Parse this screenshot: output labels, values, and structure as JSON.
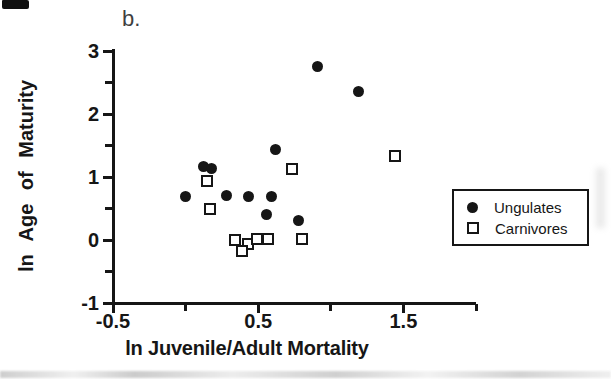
{
  "panel_label": "b.",
  "colors": {
    "ink": "#161616",
    "scan_band": "#c6c6c6"
  },
  "chart_data": {
    "type": "scatter",
    "title": "",
    "xlabel": "ln Juvenile/Adult Mortality",
    "ylabel": "ln Age of Maturity",
    "xlim": [
      -0.5,
      2.0
    ],
    "ylim": [
      -1,
      3
    ],
    "grid": false,
    "legend_position": "right-middle",
    "x_ticks": [
      {
        "v": -0.5,
        "label": "-0.5"
      },
      {
        "v": 0.0,
        "label": ""
      },
      {
        "v": 0.5,
        "label": "0.5"
      },
      {
        "v": 1.0,
        "label": ""
      },
      {
        "v": 1.5,
        "label": "1.5"
      },
      {
        "v": 2.0,
        "label": ""
      }
    ],
    "y_ticks": [
      {
        "v": 3,
        "label": "3"
      },
      {
        "v": 2.5,
        "label": ""
      },
      {
        "v": 2,
        "label": "2"
      },
      {
        "v": 1.5,
        "label": ""
      },
      {
        "v": 1,
        "label": "1"
      },
      {
        "v": 0.5,
        "label": ""
      },
      {
        "v": 0,
        "label": "0"
      },
      {
        "v": -0.5,
        "label": ""
      },
      {
        "v": -1,
        "label": "-1"
      }
    ],
    "series": [
      {
        "name": "Ungulates",
        "marker": "filled-circle",
        "points": [
          [
            0.91,
            2.76
          ],
          [
            1.19,
            2.35
          ],
          [
            0.62,
            1.43
          ],
          [
            0.12,
            1.16
          ],
          [
            0.18,
            1.13
          ],
          [
            0.0,
            0.69
          ],
          [
            0.28,
            0.7
          ],
          [
            0.43,
            0.69
          ],
          [
            0.59,
            0.69
          ],
          [
            0.56,
            0.41
          ],
          [
            0.78,
            0.31
          ]
        ]
      },
      {
        "name": "Carnivores",
        "marker": "open-square",
        "points": [
          [
            1.44,
            1.34
          ],
          [
            0.73,
            1.12
          ],
          [
            0.15,
            0.94
          ],
          [
            0.17,
            0.5
          ],
          [
            0.34,
            0.0
          ],
          [
            0.43,
            -0.06
          ],
          [
            0.39,
            -0.18
          ],
          [
            0.49,
            0.01
          ],
          [
            0.57,
            0.01
          ],
          [
            0.8,
            0.01
          ]
        ]
      }
    ]
  },
  "legend": {
    "items": [
      {
        "label": "Ungulates",
        "marker": "filled-circle"
      },
      {
        "label": "Carnivores",
        "marker": "open-square"
      }
    ]
  }
}
